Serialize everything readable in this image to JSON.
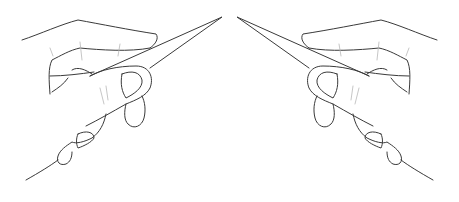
{
  "illustration": {
    "description": "Line drawing of two mirrored hands each holding a long pointed tool, tips meeting near the top center",
    "stroke_color": "#3a3a3a",
    "background_color": "#ffffff",
    "figures": [
      {
        "side": "left",
        "subject": "hand holding pointed tool",
        "tip_direction": "up-right"
      },
      {
        "side": "right",
        "subject": "hand holding pointed tool",
        "tip_direction": "up-left"
      }
    ]
  }
}
